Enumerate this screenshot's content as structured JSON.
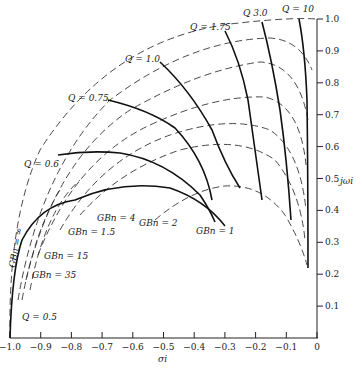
{
  "axes": {
    "x_label": "σi",
    "y_label": "jωi",
    "x_ticks": [
      "−1.0",
      "−0.9",
      "−0.8",
      "−0.7",
      "−0.6",
      "−0.5",
      "−0.4",
      "−0.3",
      "−0.2",
      "−0.1",
      "0"
    ],
    "y_ticks": [
      "0.1",
      "0.2",
      "0.3",
      "0.4",
      "0.5",
      "0.6",
      "0.7",
      "0.8",
      "0.9",
      "1.0"
    ]
  },
  "q_labels": {
    "q0_5": "Q = 0.5",
    "q0_6": "Q = 0.6",
    "q0_75": "Q = 0.75",
    "q1_0": "Q = 1.0",
    "q1_75": "Q = 1.75",
    "q3_0": "Q 3.0",
    "q10": "Q = 10"
  },
  "gb_labels": {
    "inf": "GBn = ∞",
    "gb35": "GBn = 35",
    "gb15": "GBn = 15",
    "gb1_5": "GBn = 1.5",
    "gb4": "GBn = 4",
    "gb2": "GBn = 2",
    "gb1": "GBn = 1"
  },
  "chart_data": {
    "type": "diagram",
    "title": "",
    "xlabel": "σi",
    "ylabel": "jωi",
    "xlim": [
      -1.0,
      0
    ],
    "ylim": [
      0,
      1.0
    ],
    "solid_curves_constant_Q": [
      {
        "name": "Q = 0.5",
        "points": [
          [
            -1.0,
            0.0
          ],
          [
            -0.97,
            0.18
          ],
          [
            -0.93,
            0.28
          ],
          [
            -0.85,
            0.36
          ],
          [
            -0.75,
            0.41
          ],
          [
            -0.63,
            0.43
          ],
          [
            -0.55,
            0.42
          ],
          [
            -0.45,
            0.37
          ]
        ]
      },
      {
        "name": "Q = 0.6",
        "points": [
          [
            -0.94,
            0.55
          ],
          [
            -0.88,
            0.57
          ],
          [
            -0.7,
            0.57
          ],
          [
            -0.58,
            0.53
          ],
          [
            -0.48,
            0.45
          ],
          [
            -0.43,
            0.4
          ]
        ]
      },
      {
        "name": "Q = 0.75",
        "points": [
          [
            -0.69,
            0.73
          ],
          [
            -0.6,
            0.69
          ],
          [
            -0.5,
            0.64
          ],
          [
            -0.42,
            0.57
          ],
          [
            -0.36,
            0.48
          ]
        ]
      },
      {
        "name": "Q = 1.0",
        "points": [
          [
            -0.52,
            0.84
          ],
          [
            -0.45,
            0.79
          ],
          [
            -0.36,
            0.69
          ],
          [
            -0.3,
            0.57
          ],
          [
            -0.27,
            0.47
          ]
        ]
      },
      {
        "name": "Q = 1.75",
        "points": [
          [
            -0.28,
            0.94
          ],
          [
            -0.23,
            0.84
          ],
          [
            -0.2,
            0.72
          ],
          [
            -0.16,
            0.56
          ],
          [
            -0.14,
            0.4
          ]
        ]
      },
      {
        "name": "Q = 3.0",
        "points": [
          [
            -0.16,
            0.97
          ],
          [
            -0.13,
            0.87
          ],
          [
            -0.11,
            0.72
          ],
          [
            -0.09,
            0.56
          ],
          [
            -0.09,
            0.35
          ]
        ]
      },
      {
        "name": "Q = 10",
        "points": [
          [
            -0.05,
            1.0
          ],
          [
            -0.04,
            0.88
          ],
          [
            -0.03,
            0.7
          ],
          [
            -0.03,
            0.5
          ],
          [
            -0.03,
            0.21
          ]
        ]
      }
    ],
    "dashed_curves_constant_GBn": [
      {
        "name": "GBn = ∞",
        "radius": 1.0
      },
      {
        "name": "GBn = 35"
      },
      {
        "name": "GBn = 15"
      },
      {
        "name": "GBn = 4"
      },
      {
        "name": "GBn = 2"
      },
      {
        "name": "GBn = 1.5"
      },
      {
        "name": "GBn = 1"
      }
    ],
    "grid": false
  }
}
